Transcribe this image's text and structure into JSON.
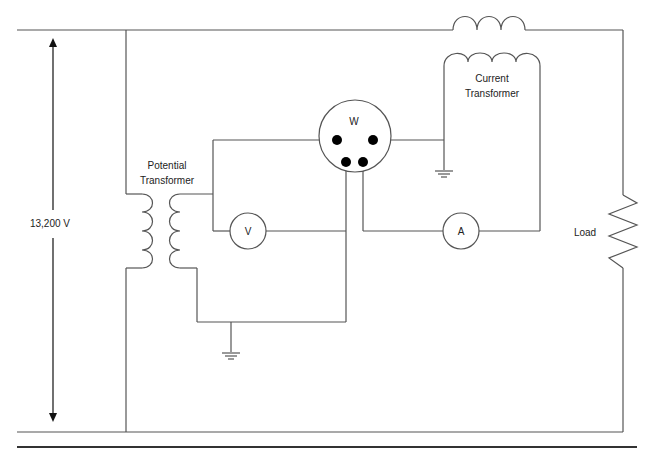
{
  "diagram": {
    "type": "circuit-schematic",
    "labels": {
      "voltage": "13,200 V",
      "potential_transformer_line1": "Potential",
      "potential_transformer_line2": "Transformer",
      "current_transformer_line1": "Current",
      "current_transformer_line2": "Transformer",
      "load": "Load"
    },
    "meters": {
      "wattmeter": "W",
      "voltmeter": "V",
      "ammeter": "A"
    },
    "components": [
      {
        "id": "primary-line-coil",
        "kind": "coil",
        "turns": 3
      },
      {
        "id": "current-transformer-secondary",
        "kind": "coil",
        "turns": 4
      },
      {
        "id": "potential-transformer-primary",
        "kind": "coil",
        "turns": 4
      },
      {
        "id": "potential-transformer-secondary",
        "kind": "coil",
        "turns": 4
      },
      {
        "id": "wattmeter",
        "kind": "meter",
        "terminals": 4
      },
      {
        "id": "voltmeter",
        "kind": "meter"
      },
      {
        "id": "ammeter",
        "kind": "meter"
      },
      {
        "id": "load",
        "kind": "resistor"
      },
      {
        "id": "ground-ct",
        "kind": "ground"
      },
      {
        "id": "ground-pt",
        "kind": "ground"
      }
    ],
    "colors": {
      "wire": "#555555",
      "terminal": "#000000",
      "text": "#222222"
    }
  }
}
